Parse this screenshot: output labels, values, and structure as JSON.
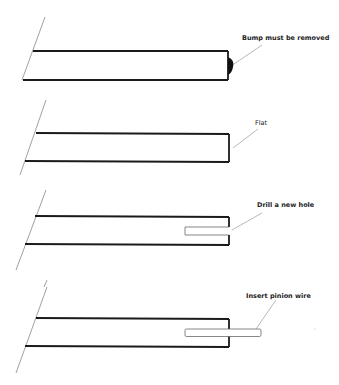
{
  "diagram": {
    "type": "process-steps",
    "colors": {
      "outline": "#1a1a1a",
      "leader": "#888888",
      "background": "#ffffff",
      "bump": "#111111"
    },
    "steps": [
      {
        "label": "Bump must be removed"
      },
      {
        "label": "Flat"
      },
      {
        "label": "Drill a new hole"
      },
      {
        "label": "Insert pinion wire"
      }
    ]
  }
}
